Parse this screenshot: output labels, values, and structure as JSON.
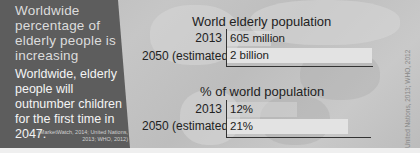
{
  "panel": {
    "headline": "Worldwide percentage of elderly people is increasing",
    "body": "Worldwide, elderly people will outnumber children for the first time in 2047.",
    "source": "(MarketWatch, 2014; United Nations, 2013; WHO, 2012)"
  },
  "credit": "United Nations, 2013; WHO, 2012",
  "colors": {
    "panel_bg": "#5d5d5d",
    "bar_fill": "#e6e6e6",
    "axis": "#333333",
    "background": "#c2c2c2"
  },
  "chart_data": [
    {
      "type": "bar",
      "orientation": "horizontal",
      "title": "World elderly population",
      "categories": [
        "2013",
        "2050 (estimated)"
      ],
      "values": [
        605,
        2000
      ],
      "value_labels": [
        "605 million",
        "2 billion"
      ],
      "unit": "million",
      "xlabel": "",
      "ylabel": "",
      "grid": false
    },
    {
      "type": "bar",
      "orientation": "horizontal",
      "title": "% of world population",
      "categories": [
        "2013",
        "2050 (estimated)"
      ],
      "values": [
        12,
        21
      ],
      "value_labels": [
        "12%",
        "21%"
      ],
      "unit": "%",
      "xlabel": "",
      "ylabel": "",
      "grid": false
    }
  ]
}
